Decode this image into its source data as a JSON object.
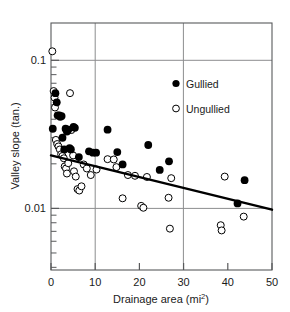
{
  "chart_data": {
    "type": "scatter",
    "title": "",
    "xlabel": "Drainage area (mi2)",
    "xlabel_base": "Drainage area (mi",
    "xlabel_sup": "2",
    "xlabel_tail": ")",
    "ylabel": "Valley slope (tan.)",
    "xlim": [
      0,
      50
    ],
    "ylim": [
      0.004,
      0.16
    ],
    "yscale": "log",
    "xscale": "linear",
    "xticks": [
      0,
      10,
      20,
      30,
      40,
      50
    ],
    "xticklabels": [
      "0",
      "10",
      "20",
      "30",
      "40",
      "50"
    ],
    "yticks": [
      0.1,
      0.01
    ],
    "yticklabels": [
      "0.1",
      "0.01"
    ],
    "grid": "major gridlines at x=10, x=30, y=0.1, y=0.01",
    "gridlines_x": [
      10,
      30
    ],
    "gridlines_y": [
      0.1,
      0.01
    ],
    "legend_position": "upper right inside axes",
    "series": [
      {
        "name": "Gullied",
        "marker": "filled-circle",
        "color": "#000000",
        "points": [
          [
            0.4,
            0.0345
          ],
          [
            1.0,
            0.06
          ],
          [
            1.3,
            0.052
          ],
          [
            1.5,
            0.0425
          ],
          [
            1.9,
            0.0425
          ],
          [
            2.1,
            0.0415
          ],
          [
            2.4,
            0.042
          ],
          [
            2.6,
            0.03
          ],
          [
            3.0,
            0.025
          ],
          [
            3.3,
            0.0345
          ],
          [
            3.6,
            0.033
          ],
          [
            3.9,
            0.034
          ],
          [
            4.2,
            0.0255
          ],
          [
            4.5,
            0.025
          ],
          [
            5.1,
            0.0355
          ],
          [
            5.4,
            0.035
          ],
          [
            6.3,
            0.0222
          ],
          [
            8.6,
            0.0243
          ],
          [
            9.5,
            0.0238
          ],
          [
            10.2,
            0.0238
          ],
          [
            12.8,
            0.034
          ],
          [
            15.0,
            0.024
          ],
          [
            16.2,
            0.0198
          ],
          [
            22.0,
            0.0268
          ],
          [
            24.6,
            0.0182
          ],
          [
            26.7,
            0.0208
          ],
          [
            42.2,
            0.0108
          ],
          [
            43.8,
            0.0155
          ]
        ]
      },
      {
        "name": "Ungullied",
        "marker": "open-circle",
        "color": "#000000",
        "points": [
          [
            0.3,
            0.115
          ],
          [
            0.6,
            0.062
          ],
          [
            0.8,
            0.056
          ],
          [
            0.9,
            0.048
          ],
          [
            1.1,
            0.029
          ],
          [
            1.4,
            0.0272
          ],
          [
            1.7,
            0.0262
          ],
          [
            2.0,
            0.025
          ],
          [
            2.3,
            0.0232
          ],
          [
            2.6,
            0.0226
          ],
          [
            2.9,
            0.0218
          ],
          [
            3.1,
            0.0192
          ],
          [
            3.4,
            0.0186
          ],
          [
            3.6,
            0.0172
          ],
          [
            3.9,
            0.0202
          ],
          [
            4.3,
            0.06
          ],
          [
            4.6,
            0.0338
          ],
          [
            5.0,
            0.0228
          ],
          [
            5.2,
            0.0178
          ],
          [
            5.6,
            0.0164
          ],
          [
            6.0,
            0.0135
          ],
          [
            6.4,
            0.0132
          ],
          [
            6.9,
            0.0141
          ],
          [
            7.4,
            0.0198
          ],
          [
            8.1,
            0.0186
          ],
          [
            9.0,
            0.0168
          ],
          [
            10.3,
            0.0183
          ],
          [
            12.8,
            0.0215
          ],
          [
            14.2,
            0.0214
          ],
          [
            14.8,
            0.019
          ],
          [
            16.2,
            0.0117
          ],
          [
            17.4,
            0.0168
          ],
          [
            19.0,
            0.0166
          ],
          [
            20.4,
            0.0104
          ],
          [
            20.9,
            0.0101
          ],
          [
            21.7,
            0.0163
          ],
          [
            26.6,
            0.0118
          ],
          [
            26.9,
            0.0073
          ],
          [
            27.2,
            0.016
          ],
          [
            38.4,
            0.0077
          ],
          [
            38.6,
            0.0071
          ],
          [
            39.3,
            0.0164
          ],
          [
            43.6,
            0.0088
          ]
        ]
      }
    ],
    "trendline": {
      "name": "regression-line",
      "x_start": 0,
      "y_start": 0.0228,
      "x_end": 50,
      "y_end": 0.0098,
      "color": "#000000",
      "width": 2.4
    }
  },
  "legend": {
    "items": [
      {
        "label": "Gullied",
        "marker": "filled-circle"
      },
      {
        "label": "Ungullied",
        "marker": "open-circle"
      }
    ]
  },
  "colors": {
    "axis": "#58595b",
    "grid": "#8c8d8f",
    "marker": "#000000",
    "text": "#1a1a1a"
  }
}
